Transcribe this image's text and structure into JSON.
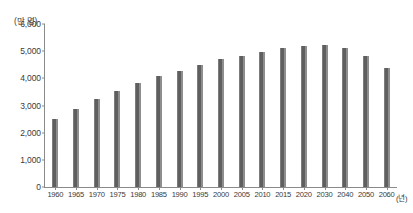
{
  "chart_data": {
    "type": "bar",
    "title": "",
    "subtitle": "",
    "xlabel": "(년)",
    "ylabel": "(만 명)",
    "unit_note_y": "(만 명)",
    "unit_note_x": "(년)",
    "categories": [
      "1960",
      "1965",
      "1970",
      "1975",
      "1980",
      "1985",
      "1990",
      "1995",
      "2000",
      "2005",
      "2010",
      "2015",
      "2020",
      "2030",
      "2040",
      "2050",
      "2060"
    ],
    "values": [
      2501,
      2870,
      3224,
      3528,
      3812,
      4081,
      4287,
      4509,
      4701,
      4814,
      4955,
      5101,
      5178,
      5216,
      5109,
      4812,
      4396
    ],
    "series": [
      {
        "name": "총인구",
        "values": [
          2501,
          2870,
          3224,
          3528,
          3812,
          4081,
          4287,
          4509,
          4701,
          4814,
          4955,
          5101,
          5178,
          5216,
          5109,
          4812,
          4396
        ]
      }
    ],
    "ylim": [
      0,
      6000
    ],
    "ytick_values": [
      0,
      1000,
      2000,
      3000,
      4000,
      5000,
      6000
    ],
    "ytick_labels": [
      "0",
      "1,000",
      "2,000",
      "3,000",
      "4,000",
      "5,000",
      "6,000"
    ],
    "xtick_labels": [
      "1960",
      "1965",
      "1970",
      "1975",
      "1980",
      "1985",
      "1990",
      "1995",
      "2000",
      "2005",
      "2010",
      "2015",
      "2020",
      "2030",
      "2040",
      "2050",
      "2060"
    ],
    "grid": false,
    "legend": null,
    "legend_position": "none",
    "bar_color": "#6b6b6b",
    "axis_color": "#8a8a8a",
    "text_color": "#3a3a3a",
    "background_color": "#ffffff",
    "annotations": []
  }
}
